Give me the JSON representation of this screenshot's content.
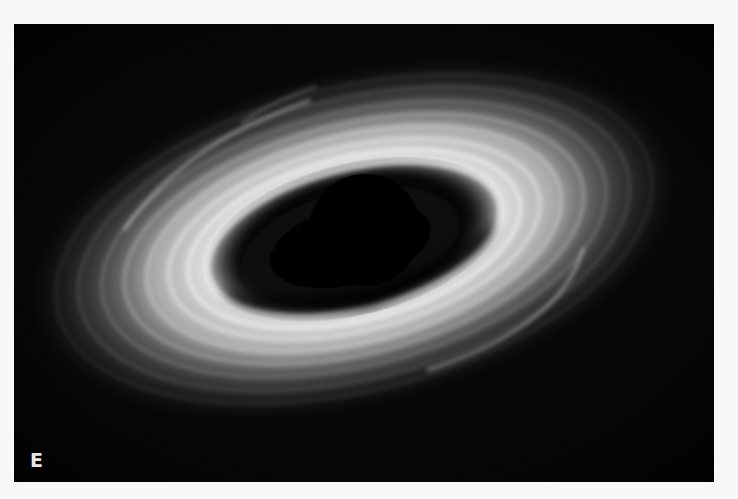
{
  "figure": {
    "panel_label": "E",
    "colors": {
      "background": "#070707",
      "disk_bright": "#f2f2f2",
      "disk_mid": "#9a9a9a",
      "hole": "#000000",
      "page": "#f7f7f7"
    }
  }
}
